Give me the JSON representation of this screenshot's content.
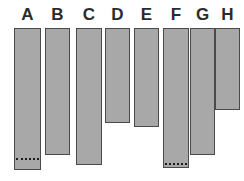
{
  "chart_data": {
    "type": "bar",
    "title": "",
    "subtitle": "",
    "xlabel": "",
    "ylabel": "",
    "orientation": "vertical-hanging",
    "grid": false,
    "legend": null,
    "baseline": "top",
    "categories": [
      "A",
      "B",
      "C",
      "D",
      "E",
      "F",
      "G",
      "H"
    ],
    "values": [
      142,
      127,
      137,
      95,
      99,
      140,
      127,
      82
    ],
    "ylim": [
      0,
      150
    ],
    "axis_visible": false,
    "tick_labels": [
      "A",
      "B",
      "C",
      "D",
      "E",
      "F",
      "G",
      "H"
    ],
    "annotations": [
      {
        "category": "A",
        "type": "dotted-line",
        "value": 129
      },
      {
        "category": "F",
        "type": "dotted-line",
        "value": 134
      }
    ],
    "bars": [
      {
        "label": "A",
        "value": 142,
        "x": 14,
        "width": 28,
        "top": 28,
        "bottom": 170,
        "marker": 157
      },
      {
        "label": "B",
        "value": 127,
        "x": 54,
        "width": 25,
        "top": 28,
        "bottom": 155,
        "marker": null
      },
      {
        "label": "C",
        "value": 137,
        "x": 90,
        "width": 25,
        "top": 28,
        "bottom": 165,
        "marker": null
      },
      {
        "label": "D",
        "value": 95,
        "x": 126,
        "width": 25,
        "top": 28,
        "bottom": 123,
        "marker": null
      },
      {
        "label": "E",
        "value": 99,
        "x": 162,
        "width": 25,
        "top": 28,
        "bottom": 127,
        "marker": null
      },
      {
        "label": "F",
        "value": 140,
        "x": 198,
        "width": 25,
        "top": 28,
        "bottom": 168,
        "marker": 162
      },
      {
        "label": "G",
        "value": 127,
        "x": 234,
        "width": 25,
        "top": 28,
        "bottom": 155,
        "marker": null
      },
      {
        "label": "H",
        "value": 82,
        "x": 270,
        "width": 25,
        "top": 28,
        "bottom": 110,
        "marker": null
      }
    ]
  },
  "style": {
    "bar_fill": "#a8a8a8",
    "bar_border": "#4a4a4a",
    "background": "#ffffff",
    "label_color": "#2b2b2b",
    "marker_color": "#1c1c1c"
  }
}
